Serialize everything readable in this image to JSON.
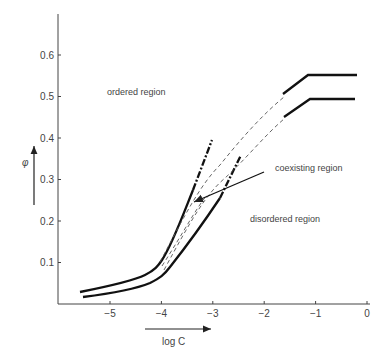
{
  "chart_data": {
    "type": "line",
    "title": "",
    "xlabel": "log C",
    "ylabel": "φ",
    "xlim": [
      -5.7,
      0
    ],
    "ylim": [
      0,
      0.7
    ],
    "grid": false,
    "x_ticks": [
      "-5",
      "-4",
      "-3",
      "-2",
      "-1",
      "0"
    ],
    "y_ticks": [
      "0.1",
      "0.2",
      "0.3",
      "0.4",
      "0.5",
      "0.6"
    ],
    "annotations": [
      {
        "text": "ordered region",
        "x": -4.9,
        "y": 0.52
      },
      {
        "text": "coexisting region",
        "x": -1.8,
        "y": 0.33
      },
      {
        "text": "disordered region",
        "x": -2.3,
        "y": 0.21
      }
    ],
    "series": [
      {
        "name": "phase boundary (ordered side)",
        "style": "solid, dash-dot extrapolation",
        "points": [
          [
            -5.6,
            0.03
          ],
          [
            -5.0,
            0.045
          ],
          [
            -4.4,
            0.065
          ],
          [
            -4.1,
            0.09
          ],
          [
            -3.9,
            0.13
          ],
          [
            -3.6,
            0.2
          ],
          [
            -3.3,
            0.28
          ],
          [
            -3.0,
            0.39
          ]
        ]
      },
      {
        "name": "phase boundary (disordered side)",
        "style": "solid, dash-dot extrapolation",
        "points": [
          [
            -5.5,
            0.02
          ],
          [
            -5.0,
            0.03
          ],
          [
            -4.4,
            0.05
          ],
          [
            -4.0,
            0.07
          ],
          [
            -3.7,
            0.12
          ],
          [
            -3.3,
            0.19
          ],
          [
            -2.9,
            0.26
          ],
          [
            -2.5,
            0.36
          ]
        ]
      },
      {
        "name": "dashed interpolation (upper)",
        "style": "dashed",
        "points": [
          [
            -4.0,
            0.1
          ],
          [
            -3.5,
            0.21
          ],
          [
            -3.0,
            0.32
          ],
          [
            -2.5,
            0.4
          ],
          [
            -2.0,
            0.46
          ],
          [
            -1.6,
            0.5
          ]
        ]
      },
      {
        "name": "dashed interpolation (lower)",
        "style": "dashed",
        "points": [
          [
            -3.9,
            0.09
          ],
          [
            -3.4,
            0.19
          ],
          [
            -2.9,
            0.28
          ],
          [
            -2.4,
            0.35
          ],
          [
            -1.9,
            0.42
          ],
          [
            -1.6,
            0.45
          ]
        ]
      },
      {
        "name": "high-concentration plateau (upper)",
        "style": "solid",
        "points": [
          [
            -1.6,
            0.51
          ],
          [
            -1.15,
            0.555
          ],
          [
            -0.2,
            0.555
          ]
        ]
      },
      {
        "name": "high-concentration plateau (lower)",
        "style": "solid",
        "points": [
          [
            -1.6,
            0.455
          ],
          [
            -1.1,
            0.495
          ],
          [
            -0.2,
            0.495
          ]
        ]
      }
    ]
  }
}
